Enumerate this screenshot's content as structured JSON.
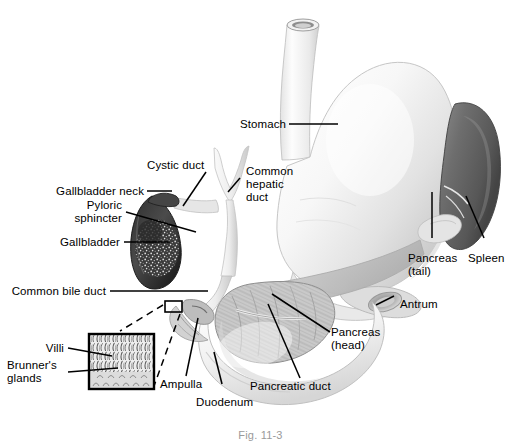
{
  "figure": {
    "caption": "Fig. 11-3",
    "background": "#ffffff",
    "ink": "#000000"
  },
  "labels": {
    "stomach": "Stomach",
    "cystic_duct": "Cystic duct",
    "common_hepatic_duct_l1": "Common",
    "common_hepatic_duct_l2": "hepatic",
    "common_hepatic_duct_l3": "duct",
    "gallbladder_neck": "Gallbladder neck",
    "pyloric_sphincter_l1": "Pyloric",
    "pyloric_sphincter_l2": "sphincter",
    "gallbladder": "Gallbladder",
    "common_bile_duct": "Common bile duct",
    "villi": "Villi",
    "brunners_glands_l1": "Brunner's",
    "brunners_glands_l2": "glands",
    "ampulla": "Ampulla",
    "duodenum": "Duodenum",
    "pancreatic_duct": "Pancreatic duct",
    "pancreas_head_l1": "Pancreas",
    "pancreas_head_l2": "(head)",
    "pancreas_tail_l1": "Pancreas",
    "pancreas_tail_l2": "(tail)",
    "antrum": "Antrum",
    "spleen": "Spleen"
  },
  "colors": {
    "stomach_fill": "#f4f4f4",
    "stomach_shade": "#d9d9d9",
    "spleen_fill": "#6f6f6f",
    "spleen_dark": "#4a4a4a",
    "gallbladder_fill": "#3a3a3a",
    "gallbladder_speckle": "#cfcfcf",
    "pancreas_fill": "#c9c9c9",
    "duct_fill": "#e8e8e8",
    "inset_border": "#000000",
    "leader": "#000000"
  }
}
